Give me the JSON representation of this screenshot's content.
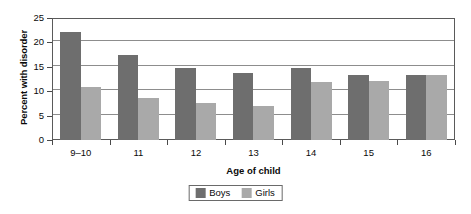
{
  "chart_data": {
    "type": "bar",
    "title": "",
    "xlabel": "Age of child",
    "ylabel": "Percent with disorder",
    "categories": [
      "9–10",
      "11",
      "12",
      "13",
      "14",
      "15",
      "16"
    ],
    "series": [
      {
        "name": "Boys",
        "color": "#6e6e6e",
        "values": [
          22.2,
          17.5,
          14.8,
          13.7,
          14.8,
          13.4,
          13.3
        ]
      },
      {
        "name": "Girls",
        "color": "#a9a9a9",
        "values": [
          10.8,
          8.7,
          7.5,
          7.0,
          11.8,
          12.0,
          13.3
        ]
      }
    ],
    "ylim": [
      0,
      25
    ],
    "yticks": [
      0,
      5,
      10,
      15,
      20,
      25
    ],
    "ytick_labels": [
      "0",
      "5",
      "10",
      "15",
      "20",
      "25"
    ],
    "grid": true,
    "grid_axis": "y",
    "legend_position": "bottom-center",
    "legend_entries": [
      "Boys",
      "Girls"
    ]
  }
}
